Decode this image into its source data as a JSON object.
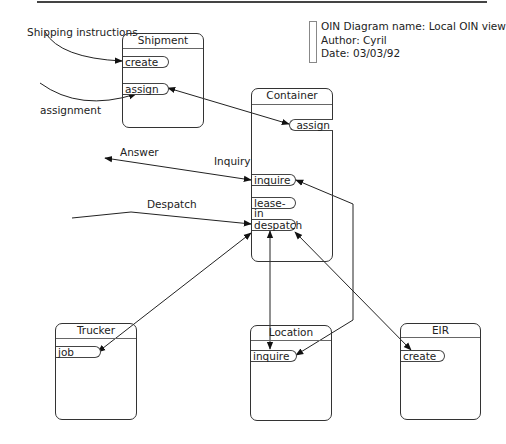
{
  "legend": {
    "diagram_name": "OIN Diagram name: Local OIN view",
    "author": "Author: Cyril",
    "date": "Date: 03/03/92"
  },
  "objects": [
    {
      "name": "Shipment",
      "operations": [
        "create",
        "assign"
      ]
    },
    {
      "name": "Container",
      "operations": [
        "assign",
        "inquire",
        "lease-in",
        "despatch"
      ]
    },
    {
      "name": "Trucker",
      "operations": [
        "job"
      ]
    },
    {
      "name": "Location",
      "operations": [
        "inquire"
      ]
    },
    {
      "name": "EIR",
      "operations": [
        "create"
      ]
    }
  ],
  "messages": {
    "shipping_instructions": "Shipping instructions",
    "assignment": "assignment",
    "answer": "Answer",
    "inquiry": "Inquiry",
    "despatch": "Despatch"
  },
  "colors": {
    "line": "#222222",
    "background": "#ffffff"
  }
}
